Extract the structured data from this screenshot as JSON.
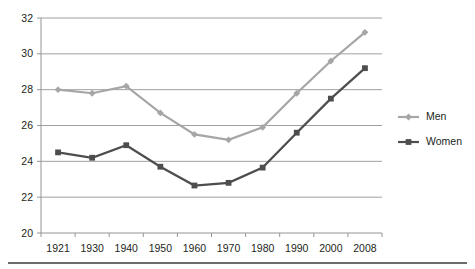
{
  "chart_data": {
    "type": "line",
    "title": "",
    "subtitle": "",
    "xlabel": "",
    "ylabel": "",
    "categories": [
      "1921",
      "1930",
      "1940",
      "1950",
      "1960",
      "1970",
      "1980",
      "1990",
      "2000",
      "2008"
    ],
    "ylim": [
      20,
      32
    ],
    "y_ticks": [
      20,
      22,
      24,
      26,
      28,
      30,
      32
    ],
    "y_tick_labels": [
      "20",
      "22",
      "24",
      "26",
      "28",
      "30",
      "32"
    ],
    "grid": true,
    "grid_axis": "y",
    "legend_position": "right",
    "series": [
      {
        "name": "Men",
        "color": "#a6a6a6",
        "marker": "diamond",
        "values": [
          28.0,
          27.8,
          28.2,
          26.7,
          25.5,
          25.2,
          25.9,
          27.8,
          29.6,
          31.2
        ]
      },
      {
        "name": "Women",
        "color": "#4d4d4d",
        "marker": "square",
        "values": [
          24.5,
          24.2,
          24.9,
          23.7,
          22.65,
          22.8,
          23.65,
          25.6,
          27.5,
          29.2
        ]
      }
    ]
  },
  "legend": {
    "entries": [
      {
        "label": "Men"
      },
      {
        "label": "Women"
      }
    ]
  },
  "colors": {
    "men": "#a6a6a6",
    "women": "#4d4d4d",
    "grid": "#939598",
    "text": "#231f20",
    "rule": "#3b3b3b"
  }
}
